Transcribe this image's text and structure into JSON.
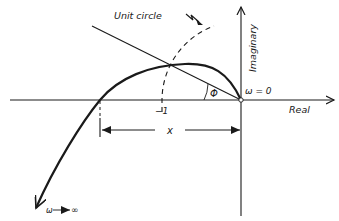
{
  "diagram": {
    "type": "nyquist-plot",
    "labels": {
      "unit_circle": "Unit circle",
      "imaginary_axis": "Imaginary",
      "real_axis": "Real",
      "omega_zero": "ω = 0",
      "minus_one": "−1",
      "x_distance": "x",
      "phi": "Φ",
      "omega_infinity": "ω ⟶ ∞"
    },
    "colors": {
      "ink": "#1a1a1a",
      "background": "#ffffff"
    }
  }
}
